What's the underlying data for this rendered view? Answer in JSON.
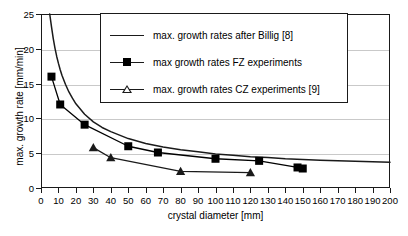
{
  "chart_data": {
    "type": "line",
    "title": "",
    "xlabel": "crystal diameter [mm]",
    "ylabel": "max. growth rate [mm/min]",
    "xlim": [
      0,
      200
    ],
    "ylim": [
      0,
      25
    ],
    "xticks": [
      0,
      10,
      20,
      30,
      40,
      50,
      60,
      70,
      80,
      90,
      100,
      110,
      120,
      130,
      140,
      150,
      160,
      170,
      180,
      190,
      200
    ],
    "yticks": [
      0,
      5,
      10,
      15,
      20,
      25
    ],
    "grid": "horizontal",
    "legend_position": "top-center",
    "series": [
      {
        "name": "max. growth rates after Billig [8]",
        "marker": "none",
        "color": "#1a1a1a",
        "x": [
          5,
          6,
          7,
          8,
          9,
          10,
          11,
          12,
          14,
          16,
          18,
          20,
          25,
          30,
          35,
          40,
          50,
          60,
          70,
          80,
          90,
          100,
          110,
          120,
          130,
          140,
          150,
          160,
          170,
          180,
          190,
          200
        ],
        "y": [
          25.0,
          23.2,
          21.5,
          20.1,
          18.9,
          17.9,
          17.0,
          16.2,
          14.9,
          13.8,
          12.9,
          12.1,
          10.6,
          9.5,
          8.7,
          8.1,
          7.1,
          6.4,
          5.9,
          5.5,
          5.2,
          4.9,
          4.7,
          4.5,
          4.4,
          4.2,
          4.1,
          4.0,
          3.9,
          3.85,
          3.78,
          3.7
        ]
      },
      {
        "name": "max growth rates FZ experiments",
        "marker": "filled-square",
        "color": "#000000",
        "x": [
          6,
          11,
          25,
          50,
          67,
          100,
          125,
          147,
          150
        ],
        "y": [
          16.0,
          12.0,
          9.1,
          6.0,
          5.1,
          4.2,
          3.9,
          2.95,
          2.8
        ]
      },
      {
        "name": "max. growth rates CZ experiments [9]",
        "marker": "triangle",
        "color": "#1a1a1a",
        "x": [
          30,
          40,
          80,
          120
        ],
        "y": [
          5.8,
          4.35,
          2.4,
          2.2
        ]
      }
    ]
  },
  "legend": {
    "entries": [
      {
        "label": "max. growth rates after Billig [8]",
        "symbol": "line-icon"
      },
      {
        "label": "max growth rates FZ experiments",
        "symbol": "line-square-icon"
      },
      {
        "label": "max. growth rates CZ experiments [9]",
        "symbol": "line-triangle-icon"
      }
    ]
  }
}
